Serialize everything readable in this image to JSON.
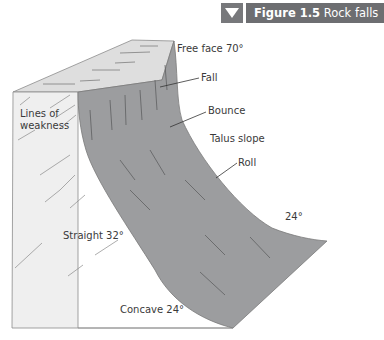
{
  "header": {
    "icon": "triangle-down-icon",
    "figure_number": "Figure 1.5",
    "figure_title": "Rock falls",
    "colors": {
      "icon_box": "#77787b",
      "title_box": "#6d6e71",
      "text": "#ffffff"
    }
  },
  "diagram": {
    "colors": {
      "cliff_fill": "#9a9b9d",
      "front_face": "#ededed",
      "top_face": "#d9d9d9",
      "streaks": "#5e5f61"
    },
    "labels": {
      "free_face": "Free face 70°",
      "fall": "Fall",
      "bounce": "Bounce",
      "talus_slope": "Talus slope",
      "roll": "Roll",
      "lines_of_weakness_1": "Lines of",
      "lines_of_weakness_2": "weakness",
      "straight": "Straight 32°",
      "concave": "Concave 24°",
      "toe_angle": "24°"
    }
  }
}
